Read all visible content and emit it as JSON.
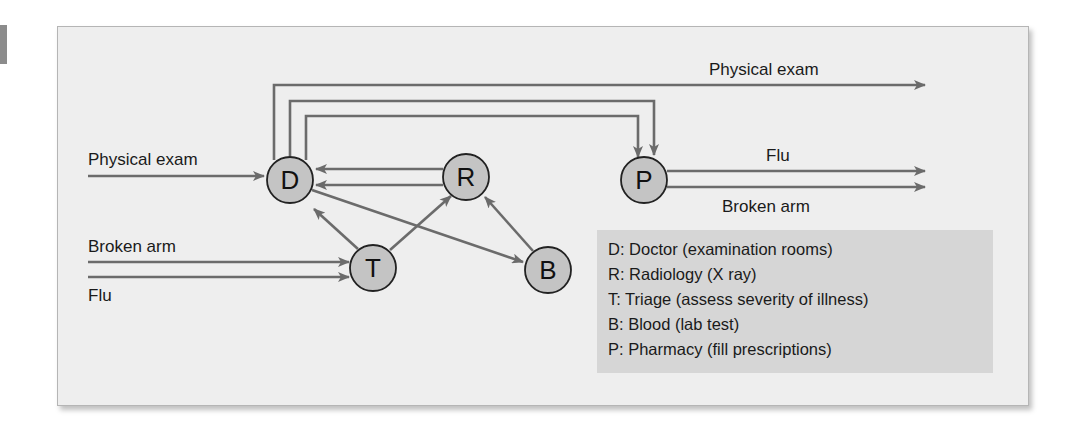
{
  "diagram": {
    "nodes": [
      {
        "id": "D",
        "letter": "D"
      },
      {
        "id": "R",
        "letter": "R"
      },
      {
        "id": "P",
        "letter": "P"
      },
      {
        "id": "T",
        "letter": "T"
      },
      {
        "id": "B",
        "letter": "B"
      }
    ],
    "edges": [
      {
        "from": "input",
        "to": "D",
        "label": "Physical exam"
      },
      {
        "from": "input",
        "to": "T",
        "label": "Broken arm"
      },
      {
        "from": "input",
        "to": "T",
        "label": "Flu"
      },
      {
        "from": "D",
        "to": "output",
        "label": "Physical exam"
      },
      {
        "from": "D",
        "to": "P",
        "label": ""
      },
      {
        "from": "D",
        "to": "P",
        "label": ""
      },
      {
        "from": "R",
        "to": "D",
        "label": ""
      },
      {
        "from": "R",
        "to": "D",
        "label": ""
      },
      {
        "from": "T",
        "to": "D",
        "label": ""
      },
      {
        "from": "T",
        "to": "R",
        "label": ""
      },
      {
        "from": "D",
        "to": "B",
        "label": ""
      },
      {
        "from": "B",
        "to": "R",
        "label": ""
      },
      {
        "from": "P",
        "to": "output",
        "label": "Flu"
      },
      {
        "from": "P",
        "to": "output",
        "label": "Broken arm"
      }
    ],
    "labels": {
      "input_physical_exam": "Physical exam",
      "input_broken_arm": "Broken arm",
      "input_flu": "Flu",
      "output_physical_exam": "Physical exam",
      "output_flu": "Flu",
      "output_broken_arm": "Broken arm"
    },
    "colors": {
      "panel": "#eeeeee",
      "legend": "#d6d6d6",
      "node_fill": "#c4c4c4",
      "arrow": "#6b6b6b"
    }
  },
  "legend": {
    "items": [
      "D: Doctor (examination rooms)",
      "R: Radiology (X ray)",
      "T: Triage (assess severity of illness)",
      "B: Blood (lab test)",
      "P: Pharmacy (fill prescriptions)"
    ]
  }
}
